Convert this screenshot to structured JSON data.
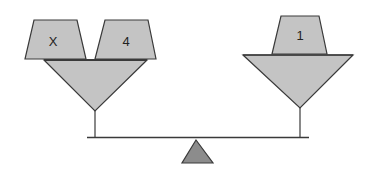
{
  "diagram": {
    "type": "balance-scale",
    "colors": {
      "fill": "#c4c4c4",
      "fulcrum": "#8c8c8c",
      "stroke": "#3a3a3a"
    },
    "left_pan": {
      "weights": [
        {
          "label": "X"
        },
        {
          "label": "4"
        }
      ]
    },
    "right_pan": {
      "weights": [
        {
          "label": "1"
        }
      ]
    }
  }
}
